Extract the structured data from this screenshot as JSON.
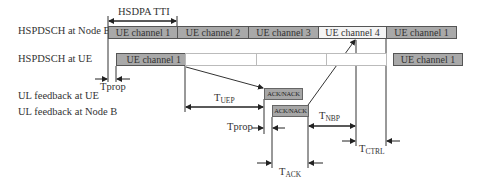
{
  "title_annotation": "HSDPA TTI",
  "row_labels": {
    "nodeb": "HSPDSCH at Node B",
    "ue": "HSPDSCH at UE",
    "ul_ue": "UL feedback at UE",
    "ul_nodeb": "UL feedback at Node B"
  },
  "nodeb_segments": [
    {
      "label": "UE channel 1",
      "style": "grey"
    },
    {
      "label": "UE channel 2",
      "style": "grey"
    },
    {
      "label": "UE channel 3",
      "style": "grey"
    },
    {
      "label": "UE channel 4",
      "style": "white"
    },
    {
      "label": "UE channel 1",
      "style": "grey"
    }
  ],
  "ue_segments": [
    {
      "label": "UE channel 1",
      "style": "grey"
    },
    {
      "label": "UE channel 1",
      "style": "grey"
    }
  ],
  "feedback": {
    "ue_ack": "ACK/NACK",
    "nodeb_ack": "ACK/NACK"
  },
  "timing_labels": {
    "tprop1": "Tprop",
    "tprop2": "Tprop",
    "tuep_main": "T",
    "tuep_sub": "UEP",
    "tnbp_main": "T",
    "tnbp_sub": "NBP",
    "tctrl_main": "T",
    "tctrl_sub": "CTRL",
    "tack_main": "T",
    "tack_sub": "ACK"
  },
  "colors": {
    "grey_fill": "#a9a9a9",
    "white_fill": "#f4f4f4",
    "line": "#333333"
  }
}
